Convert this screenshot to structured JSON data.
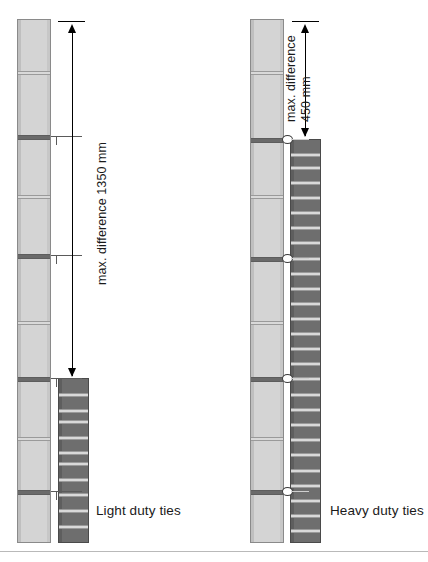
{
  "figure": {
    "width": 428,
    "height": 562,
    "background": "#ffffff"
  },
  "colors": {
    "rail_fill": "#d4d4d4",
    "rail_border": "#8a8a8a",
    "tie_fill": "#6e6e6e",
    "tie_border": "#4a4a4a",
    "joint": "#8d8d8d",
    "dimension_line": "#000000",
    "text": "#1a1a1a"
  },
  "assemblies": [
    {
      "id": "light-duty",
      "caption": "Light duty ties",
      "dimension": {
        "label_prefix": "max. difference",
        "value": "1350",
        "unit": "mm",
        "full_label": "max. difference 1350 mm"
      },
      "rail": {
        "x": 17,
        "y": 19,
        "width": 34,
        "height": 524,
        "joints_y": [
          72,
          136,
          196,
          255,
          322,
          378,
          438,
          491
        ],
        "major_joints_y": [
          136,
          255,
          378,
          491
        ]
      },
      "tiebar": {
        "x": 58,
        "y": 378,
        "width": 31,
        "height": 165,
        "bands_y": [
          394,
          410,
          421,
          437,
          452,
          463,
          479,
          494,
          510,
          526
        ],
        "segment_count": 10
      }
    },
    {
      "id": "heavy-duty",
      "caption": "Heavy duty ties",
      "dimension": {
        "label_prefix": "max. difference",
        "value": "450",
        "unit": "mm",
        "full_label": "max. difference 450 mm"
      },
      "rail": {
        "x": 250,
        "y": 19,
        "width": 34,
        "height": 524,
        "joints_y": [
          72,
          139,
          196,
          258,
          322,
          378,
          438,
          491
        ],
        "major_joints_y": [
          139,
          258,
          378,
          491
        ]
      },
      "tiebar": {
        "x": 290,
        "y": 139,
        "width": 31,
        "height": 404,
        "bands_y": [
          152,
          165,
          180,
          195,
          210,
          225,
          240,
          256,
          271,
          286,
          301,
          316,
          331,
          346,
          361,
          376,
          392,
          407,
          422,
          437,
          452,
          468,
          483,
          498,
          513,
          528
        ],
        "segment_count": 26
      },
      "connectors_y": [
        139,
        258,
        378,
        491
      ]
    }
  ]
}
